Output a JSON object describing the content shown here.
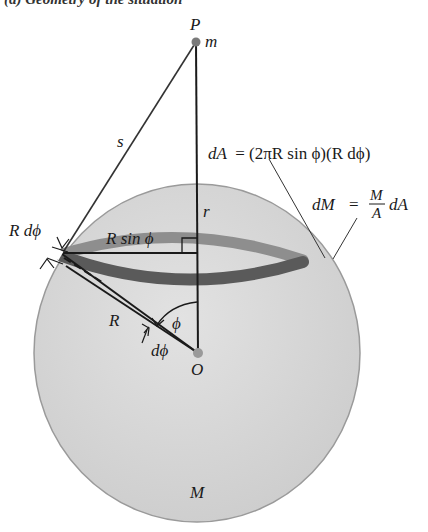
{
  "caption": "(a) Geometry of the situation",
  "colors": {
    "sphere_fill": "#d4d4d4",
    "sphere_edge": "#9a9a9a",
    "ring_back": "#8e8e8e",
    "ring_front": "#5a5a5a",
    "line": "#1a1a1a",
    "point": "#8a8a8a"
  },
  "labels": {
    "point_p": "P",
    "mass_m": "m",
    "distance_s": "s",
    "distance_r": "r",
    "radius_R": "R",
    "ring_radius": "R sin ϕ",
    "arc_width": "R dϕ",
    "angle_phi": "ϕ",
    "angle_dphi": "dϕ",
    "center_o": "O",
    "sphere_mass": "M",
    "dA_lhs": "dA",
    "dA_rhs": "= (2πR sin ϕ)(R dϕ)",
    "dM_lhs": "dM",
    "dM_eq": "=",
    "dM_num": "M",
    "dM_den": "A",
    "dM_tail": "dA"
  }
}
